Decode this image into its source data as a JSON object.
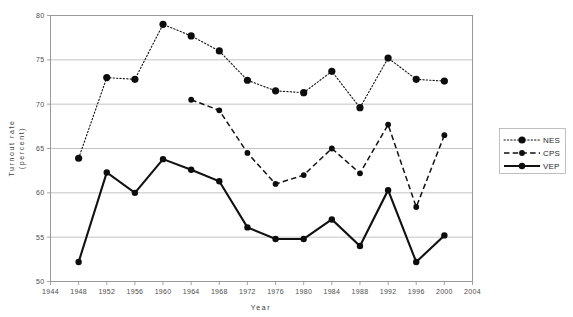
{
  "chart_data": {
    "type": "line",
    "title": "",
    "xlabel": "Year",
    "ylabel": "Turnout rate (percent)",
    "xlim": [
      1944,
      2004
    ],
    "ylim": [
      50,
      80
    ],
    "xticks": [
      1944,
      1948,
      1952,
      1956,
      1960,
      1964,
      1968,
      1972,
      1976,
      1980,
      1984,
      1988,
      1992,
      1996,
      2000,
      2004
    ],
    "yticks": [
      50,
      55,
      60,
      65,
      70,
      75,
      80
    ],
    "grid": "horizontal",
    "legend_position": "right-outside",
    "series": [
      {
        "name": "NES",
        "style": "dotted",
        "x": [
          1948,
          1952,
          1956,
          1960,
          1964,
          1968,
          1972,
          1976,
          1980,
          1984,
          1988,
          1992,
          1996,
          2000
        ],
        "values": [
          63.9,
          73.0,
          72.8,
          79.0,
          77.7,
          76.0,
          72.7,
          71.5,
          71.3,
          73.7,
          69.6,
          75.2,
          72.8,
          72.6
        ]
      },
      {
        "name": "CPS",
        "style": "dashed",
        "x": [
          1964,
          1968,
          1972,
          1976,
          1980,
          1984,
          1988,
          1992,
          1996,
          2000
        ],
        "values": [
          70.5,
          69.3,
          64.5,
          61.0,
          62.0,
          65.0,
          62.2,
          67.7,
          58.4,
          66.5
        ]
      },
      {
        "name": "VEP",
        "style": "solid",
        "x": [
          1948,
          1952,
          1956,
          1960,
          1964,
          1968,
          1972,
          1976,
          1980,
          1984,
          1988,
          1992,
          1996,
          2000
        ],
        "values": [
          52.2,
          62.3,
          60.0,
          63.8,
          62.6,
          61.3,
          56.1,
          54.8,
          54.8,
          57.0,
          54.0,
          60.3,
          52.2,
          55.2
        ]
      }
    ]
  },
  "legend": {
    "items": [
      {
        "label": "NES"
      },
      {
        "label": "CPS"
      },
      {
        "label": "VEP"
      }
    ]
  },
  "axes": {
    "x_title": "Year",
    "y_title_line1": "Turnout rate",
    "y_title_line2": "(percent)"
  }
}
